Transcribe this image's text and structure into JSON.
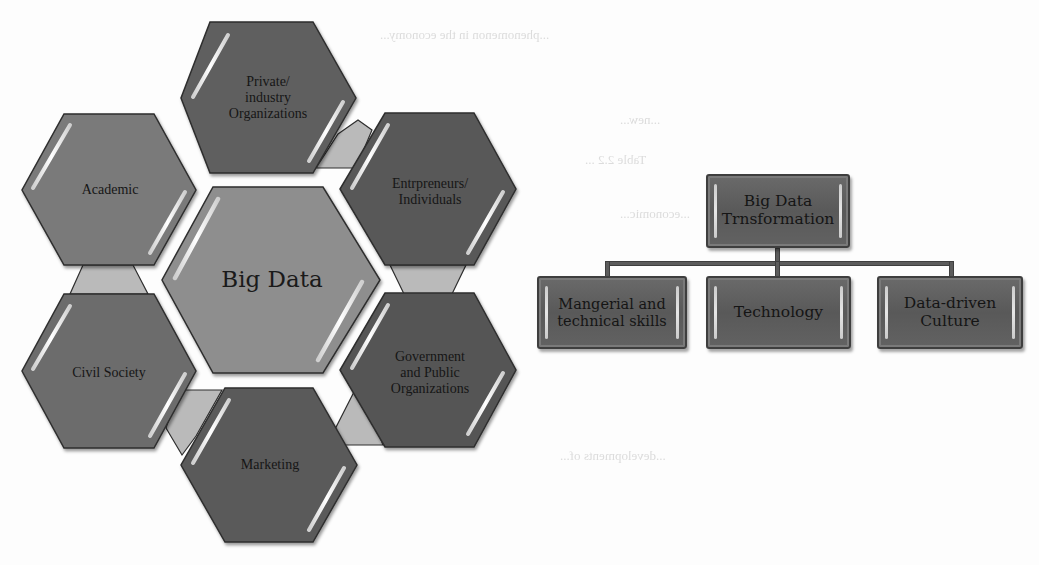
{
  "hexagon_diagram": {
    "center": {
      "label": "Big Data"
    },
    "stakeholders": [
      {
        "id": "private",
        "label": "Private/\nindustry\nOrganizations",
        "lines": [
          "Private/",
          "industry",
          "Organizations"
        ],
        "fill": "#5f5f5f"
      },
      {
        "id": "academic",
        "label": "Academic",
        "lines": [
          "Academic"
        ],
        "fill": "#7a7a7a"
      },
      {
        "id": "entrepreneurs",
        "label": "Entrepreneurs/ Individuals",
        "lines": [
          "Entrpreneurs/",
          "Individuals"
        ],
        "fill": "#585858"
      },
      {
        "id": "civil",
        "label": "Civil Society",
        "lines": [
          "Civil Society"
        ],
        "fill": "#6c6c6c"
      },
      {
        "id": "government",
        "label": "Government and Public Organizations",
        "lines": [
          "Government",
          "and Public",
          "Organizations"
        ],
        "fill": "#555555"
      },
      {
        "id": "marketing",
        "label": "Marketing",
        "lines": [
          "Marketing"
        ],
        "fill": "#5a5a5a"
      }
    ],
    "colors": {
      "center_fill": "#8e8e8e",
      "connector_fill": "#b9b9b9",
      "outline": "#2e2e2e",
      "highlight": "#f2f2f2"
    }
  },
  "org_chart": {
    "root": {
      "lines": [
        "Big Data",
        "Trnsformation"
      ]
    },
    "children": [
      {
        "lines": [
          "Mangerial and",
          "technical skills"
        ]
      },
      {
        "lines": [
          "Technology"
        ]
      },
      {
        "lines": [
          "Data-driven",
          "Culture"
        ]
      }
    ],
    "colors": {
      "box_fill": "#616161",
      "line": "#5c5c5c"
    }
  },
  "background_ghost_text": [
    "...phenomenon in the economy...",
    "Table 2.2 ...",
    "...economic...",
    "...new...",
    "...developments of..."
  ]
}
